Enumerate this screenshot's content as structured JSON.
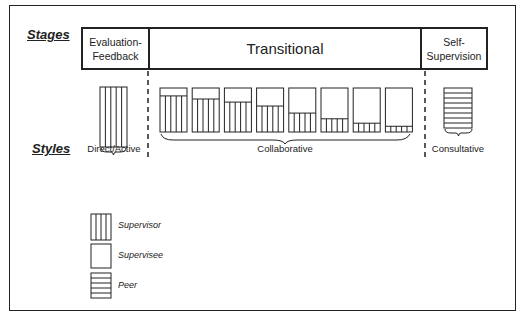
{
  "row_labels": {
    "stages": "Stages",
    "styles": "Styles"
  },
  "stages": [
    {
      "id": "evaluation-feedback",
      "line1": "Evaluation-",
      "line2": "Feedback"
    },
    {
      "id": "transitional",
      "label": "Transitional"
    },
    {
      "id": "self-supervision",
      "line1": "Self-",
      "line2": "Supervision"
    }
  ],
  "styles": [
    {
      "id": "direct-active",
      "label": "Direct/Active",
      "bars": [
        {
          "supervisor_pct": 100,
          "supervisee_pct": 0
        }
      ]
    },
    {
      "id": "collaborative",
      "label": "Collaborative",
      "bars": [
        {
          "supervisee_pct": 18,
          "supervisor_pct": 82
        },
        {
          "supervisee_pct": 25,
          "supervisor_pct": 75
        },
        {
          "supervisee_pct": 32,
          "supervisor_pct": 68
        },
        {
          "supervisee_pct": 41,
          "supervisor_pct": 59
        },
        {
          "supervisee_pct": 57,
          "supervisor_pct": 43
        },
        {
          "supervisee_pct": 70,
          "supervisor_pct": 30
        },
        {
          "supervisee_pct": 80,
          "supervisor_pct": 20
        },
        {
          "supervisee_pct": 87,
          "supervisor_pct": 13
        }
      ]
    },
    {
      "id": "consultative",
      "label": "Consultative",
      "bars": [
        {
          "peer_pct": 100
        }
      ]
    }
  ],
  "legend": [
    {
      "pattern": "vertical-lines",
      "label": "Supervisor"
    },
    {
      "pattern": "blank",
      "label": "Supervisee"
    },
    {
      "pattern": "horizontal-lines",
      "label": "Peer"
    }
  ]
}
